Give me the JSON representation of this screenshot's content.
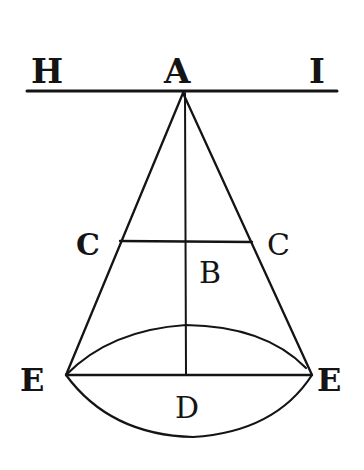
{
  "figure": {
    "labels": {
      "H": "H",
      "A": "A",
      "I": "I",
      "C_left": "C",
      "C_right": "C",
      "B": "B",
      "E_left": "E",
      "E_right": "E",
      "D": "D"
    },
    "colors": {
      "ink": "#141414",
      "background": "#ffffff"
    }
  }
}
